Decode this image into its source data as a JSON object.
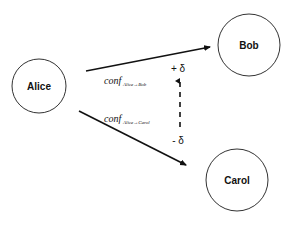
{
  "nodes": {
    "alice": {
      "label": "Alice"
    },
    "bob": {
      "label": "Bob"
    },
    "carol": {
      "label": "Carol"
    }
  },
  "edges": {
    "alice_bob": {
      "label_main": "conf",
      "label_sub": "Alice→Bob"
    },
    "alice_carol": {
      "label_main": "conf",
      "label_sub": "Alice→Carol"
    }
  },
  "adjustment": {
    "plus_label": "+ δ",
    "minus_label": "- δ"
  }
}
